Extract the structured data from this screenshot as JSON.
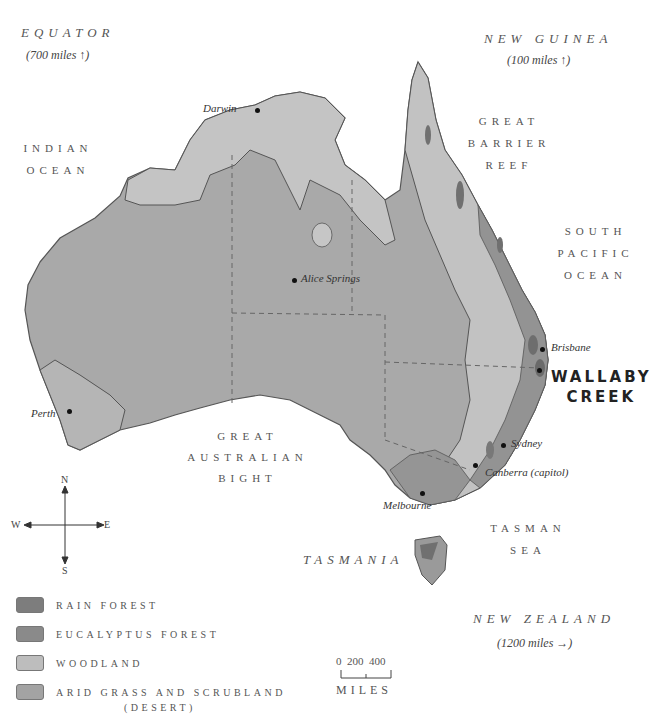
{
  "map": {
    "title_regions": {
      "equator": {
        "label": "EQUATOR",
        "distance": "(700 miles ↑)"
      },
      "new_guinea": {
        "label": "NEW GUINEA",
        "distance": "(100 miles ↑)"
      },
      "new_zealand": {
        "label": "NEW ZEALAND",
        "distance": "(1200 miles →)"
      }
    },
    "water_bodies": {
      "indian_ocean": [
        "INDIAN",
        "OCEAN"
      ],
      "great_barrier_reef": [
        "GREAT",
        "BARRIER",
        "REEF"
      ],
      "south_pacific_ocean": [
        "SOUTH",
        "PACIFIC",
        "OCEAN"
      ],
      "great_australian_bight": [
        "GREAT",
        "AUSTRALIAN",
        "BIGHT"
      ],
      "tasman_sea": [
        "TASMAN",
        "SEA"
      ]
    },
    "islands": {
      "tasmania": "TASMANIA"
    },
    "cities": [
      {
        "name": "Darwin",
        "x": 257,
        "y": 110
      },
      {
        "name": "Alice Springs",
        "x": 294,
        "y": 280
      },
      {
        "name": "Brisbane",
        "x": 542,
        "y": 349
      },
      {
        "name": "Perth",
        "x": 69,
        "y": 411
      },
      {
        "name": "Sydney",
        "x": 503,
        "y": 445
      },
      {
        "name": "Canberra (capitol)",
        "x": 475,
        "y": 465
      },
      {
        "name": "Melbourne",
        "x": 422,
        "y": 493
      }
    ],
    "highlight": {
      "line1": "WALLABY",
      "line2": "CREEK",
      "x": 540,
      "y": 370
    },
    "compass": {
      "n": "N",
      "s": "S",
      "e": "E",
      "w": "W"
    },
    "scale": {
      "ticks": [
        "0",
        "200",
        "400"
      ],
      "unit": "MILES"
    },
    "legend": [
      {
        "label": "RAIN FOREST",
        "color": "#7d7d7d"
      },
      {
        "label": "EUCALYPTUS FOREST",
        "color": "#8a8a8a"
      },
      {
        "label": "WOODLAND",
        "color": "#bdbdbd"
      },
      {
        "label": "ARID GRASS AND SCRUBLAND",
        "sublabel": "(DESERT)",
        "color": "#a3a3a3"
      }
    ],
    "colors": {
      "desert": "#a9a9a9",
      "woodland": "#c4c4c4",
      "eucalyptus": "#939393",
      "rainforest": "#707070",
      "coast_line": "#555555",
      "border_dash": "#666666"
    }
  }
}
